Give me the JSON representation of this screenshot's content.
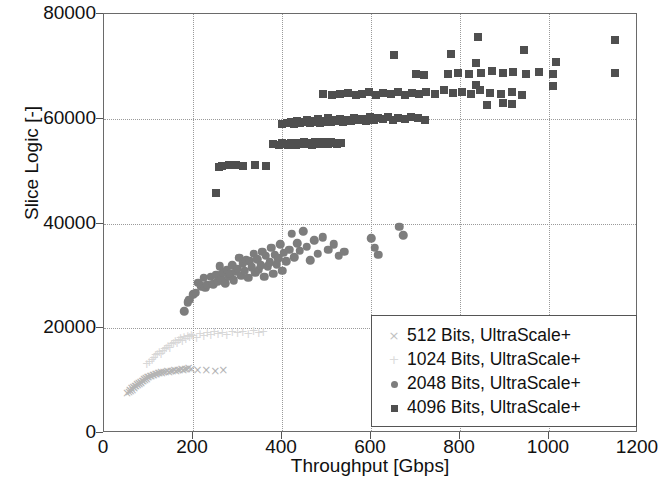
{
  "chart_data": {
    "type": "scatter",
    "title": "",
    "xlabel": "Throughput [Gbps]",
    "ylabel": "Slice Logic [-]",
    "xlim": [
      0,
      1200
    ],
    "ylim": [
      0,
      80000
    ],
    "xticks": [
      0,
      200,
      400,
      600,
      800,
      1000,
      1200
    ],
    "yticks": [
      0,
      20000,
      40000,
      60000,
      80000
    ],
    "grid": true,
    "legend_position": "lower right",
    "series": [
      {
        "name": "512 Bits, UltraScale+",
        "marker": "x",
        "color": "#b4b4b4",
        "points": [
          [
            52,
            7600
          ],
          [
            56,
            7900
          ],
          [
            58,
            8200
          ],
          [
            60,
            8000
          ],
          [
            62,
            8500
          ],
          [
            64,
            8300
          ],
          [
            66,
            8800
          ],
          [
            68,
            8600
          ],
          [
            70,
            9000
          ],
          [
            72,
            8900
          ],
          [
            74,
            9300
          ],
          [
            76,
            9100
          ],
          [
            78,
            9500
          ],
          [
            80,
            9400
          ],
          [
            82,
            9800
          ],
          [
            84,
            9600
          ],
          [
            86,
            10000
          ],
          [
            88,
            9900
          ],
          [
            90,
            10300
          ],
          [
            92,
            10100
          ],
          [
            94,
            10500
          ],
          [
            96,
            10400
          ],
          [
            98,
            10700
          ],
          [
            100,
            10600
          ],
          [
            104,
            10900
          ],
          [
            106,
            10800
          ],
          [
            110,
            11100
          ],
          [
            112,
            11000
          ],
          [
            116,
            11300
          ],
          [
            118,
            11200
          ],
          [
            122,
            11500
          ],
          [
            124,
            11400
          ],
          [
            128,
            11600
          ],
          [
            130,
            11500
          ],
          [
            134,
            11700
          ],
          [
            138,
            11600
          ],
          [
            142,
            11800
          ],
          [
            146,
            11700
          ],
          [
            150,
            11900
          ],
          [
            154,
            11800
          ],
          [
            158,
            12000
          ],
          [
            162,
            11900
          ],
          [
            166,
            12100
          ],
          [
            170,
            12000
          ],
          [
            174,
            12200
          ],
          [
            178,
            12100
          ],
          [
            182,
            12300
          ],
          [
            186,
            12200
          ],
          [
            190,
            12400
          ],
          [
            196,
            12300
          ],
          [
            210,
            12000
          ],
          [
            230,
            12000
          ],
          [
            250,
            11900
          ],
          [
            268,
            12100
          ]
        ]
      },
      {
        "name": "1024 Bits, UltraScale+",
        "marker": "+",
        "color": "#d8d8d8",
        "points": [
          [
            96,
            13200
          ],
          [
            102,
            13600
          ],
          [
            108,
            14000
          ],
          [
            112,
            14400
          ],
          [
            116,
            14800
          ],
          [
            120,
            15100
          ],
          [
            124,
            15400
          ],
          [
            128,
            15000
          ],
          [
            132,
            15700
          ],
          [
            136,
            16000
          ],
          [
            140,
            16300
          ],
          [
            144,
            16600
          ],
          [
            148,
            16200
          ],
          [
            152,
            16900
          ],
          [
            156,
            17200
          ],
          [
            160,
            17500
          ],
          [
            164,
            17100
          ],
          [
            168,
            17800
          ],
          [
            172,
            18100
          ],
          [
            176,
            17600
          ],
          [
            180,
            18400
          ],
          [
            184,
            18000
          ],
          [
            188,
            18600
          ],
          [
            192,
            18300
          ],
          [
            196,
            18800
          ],
          [
            200,
            18500
          ],
          [
            208,
            18200
          ],
          [
            216,
            18900
          ],
          [
            224,
            18600
          ],
          [
            232,
            19000
          ],
          [
            240,
            18700
          ],
          [
            248,
            19200
          ],
          [
            256,
            18900
          ],
          [
            266,
            19100
          ],
          [
            276,
            18800
          ],
          [
            288,
            19300
          ],
          [
            300,
            19000
          ],
          [
            312,
            19200
          ],
          [
            324,
            18900
          ],
          [
            336,
            19400
          ],
          [
            348,
            19100
          ],
          [
            358,
            19300
          ]
        ]
      },
      {
        "name": "2048 Bits, UltraScale+",
        "marker": "o",
        "color": "#7d7d7d",
        "points": [
          [
            180,
            23200
          ],
          [
            188,
            25000
          ],
          [
            192,
            25400
          ],
          [
            200,
            26500
          ],
          [
            206,
            26800
          ],
          [
            212,
            28700
          ],
          [
            218,
            28000
          ],
          [
            224,
            29600
          ],
          [
            228,
            27700
          ],
          [
            232,
            28300
          ],
          [
            240,
            29800
          ],
          [
            246,
            28400
          ],
          [
            252,
            30200
          ],
          [
            256,
            29000
          ],
          [
            260,
            31800
          ],
          [
            264,
            29400
          ],
          [
            268,
            30600
          ],
          [
            272,
            28600
          ],
          [
            276,
            31200
          ],
          [
            280,
            29800
          ],
          [
            284,
            30400
          ],
          [
            288,
            32000
          ],
          [
            292,
            29200
          ],
          [
            296,
            30800
          ],
          [
            300,
            31400
          ],
          [
            304,
            33500
          ],
          [
            308,
            30000
          ],
          [
            312,
            32400
          ],
          [
            316,
            31000
          ],
          [
            320,
            33000
          ],
          [
            324,
            29600
          ],
          [
            328,
            32800
          ],
          [
            332,
            31600
          ],
          [
            336,
            34200
          ],
          [
            340,
            30600
          ],
          [
            344,
            33200
          ],
          [
            348,
            31200
          ],
          [
            352,
            32000
          ],
          [
            356,
            34600
          ],
          [
            360,
            29800
          ],
          [
            364,
            33800
          ],
          [
            368,
            31800
          ],
          [
            372,
            32600
          ],
          [
            376,
            35400
          ],
          [
            380,
            30400
          ],
          [
            384,
            34000
          ],
          [
            388,
            32200
          ],
          [
            392,
            33400
          ],
          [
            396,
            36000
          ],
          [
            400,
            31000
          ],
          [
            404,
            34400
          ],
          [
            410,
            32800
          ],
          [
            416,
            35000
          ],
          [
            422,
            38000
          ],
          [
            428,
            33600
          ],
          [
            434,
            36200
          ],
          [
            440,
            34800
          ],
          [
            448,
            38500
          ],
          [
            456,
            35600
          ],
          [
            464,
            33000
          ],
          [
            472,
            36800
          ],
          [
            480,
            34200
          ],
          [
            492,
            37400
          ],
          [
            504,
            35000
          ],
          [
            516,
            36000
          ],
          [
            528,
            33800
          ],
          [
            540,
            34600
          ],
          [
            600,
            37200
          ],
          [
            608,
            35400
          ],
          [
            616,
            34000
          ],
          [
            664,
            39400
          ],
          [
            672,
            37800
          ]
        ]
      },
      {
        "name": "4096 Bits, UltraScale+",
        "marker": "s",
        "color": "#4f4f4f",
        "points": [
          [
            252,
            45800
          ],
          [
            258,
            50800
          ],
          [
            266,
            51000
          ],
          [
            282,
            51200
          ],
          [
            296,
            51200
          ],
          [
            312,
            51000
          ],
          [
            340,
            51200
          ],
          [
            364,
            51000
          ],
          [
            380,
            55200
          ],
          [
            394,
            55000
          ],
          [
            400,
            55400
          ],
          [
            406,
            55200
          ],
          [
            414,
            55000
          ],
          [
            420,
            55400
          ],
          [
            426,
            55200
          ],
          [
            432,
            55000
          ],
          [
            438,
            55400
          ],
          [
            444,
            55200
          ],
          [
            450,
            55600
          ],
          [
            456,
            55200
          ],
          [
            462,
            55400
          ],
          [
            468,
            55000
          ],
          [
            474,
            55600
          ],
          [
            480,
            55400
          ],
          [
            486,
            55200
          ],
          [
            492,
            55600
          ],
          [
            498,
            55400
          ],
          [
            504,
            55200
          ],
          [
            510,
            55600
          ],
          [
            516,
            55400
          ],
          [
            524,
            55200
          ],
          [
            532,
            55400
          ],
          [
            400,
            59000
          ],
          [
            412,
            59200
          ],
          [
            420,
            59400
          ],
          [
            428,
            59000
          ],
          [
            434,
            59600
          ],
          [
            440,
            59200
          ],
          [
            448,
            59400
          ],
          [
            456,
            59800
          ],
          [
            462,
            59200
          ],
          [
            468,
            59600
          ],
          [
            474,
            59400
          ],
          [
            480,
            60000
          ],
          [
            486,
            59200
          ],
          [
            492,
            59600
          ],
          [
            498,
            59400
          ],
          [
            504,
            60200
          ],
          [
            510,
            59400
          ],
          [
            516,
            59800
          ],
          [
            522,
            59600
          ],
          [
            530,
            60000
          ],
          [
            538,
            59400
          ],
          [
            546,
            59800
          ],
          [
            554,
            59600
          ],
          [
            562,
            60200
          ],
          [
            570,
            59800
          ],
          [
            580,
            60000
          ],
          [
            588,
            59600
          ],
          [
            598,
            60400
          ],
          [
            606,
            59800
          ],
          [
            616,
            60200
          ],
          [
            626,
            60000
          ],
          [
            638,
            60400
          ],
          [
            650,
            59800
          ],
          [
            660,
            60200
          ],
          [
            676,
            60000
          ],
          [
            690,
            60400
          ],
          [
            706,
            60200
          ],
          [
            722,
            59800
          ],
          [
            492,
            64800
          ],
          [
            512,
            64600
          ],
          [
            530,
            64800
          ],
          [
            548,
            65000
          ],
          [
            566,
            64600
          ],
          [
            580,
            64800
          ],
          [
            596,
            65200
          ],
          [
            612,
            64600
          ],
          [
            628,
            65000
          ],
          [
            644,
            64800
          ],
          [
            660,
            65200
          ],
          [
            676,
            64600
          ],
          [
            692,
            65000
          ],
          [
            708,
            64800
          ],
          [
            724,
            65200
          ],
          [
            744,
            64800
          ],
          [
            764,
            65400
          ],
          [
            784,
            65000
          ],
          [
            804,
            65200
          ],
          [
            824,
            64800
          ],
          [
            844,
            65400
          ],
          [
            868,
            65000
          ],
          [
            892,
            64800
          ],
          [
            916,
            65200
          ],
          [
            940,
            64600
          ],
          [
            700,
            68600
          ],
          [
            720,
            68400
          ],
          [
            772,
            68600
          ],
          [
            796,
            68800
          ],
          [
            820,
            68600
          ],
          [
            848,
            68800
          ],
          [
            872,
            69200
          ],
          [
            896,
            68800
          ],
          [
            920,
            69000
          ],
          [
            948,
            68600
          ],
          [
            978,
            69000
          ],
          [
            1008,
            68600
          ],
          [
            1148,
            68800
          ],
          [
            652,
            72200
          ],
          [
            780,
            72400
          ],
          [
            840,
            75600
          ],
          [
            1148,
            75000
          ],
          [
            944,
            73200
          ],
          [
            896,
            63000
          ],
          [
            916,
            62800
          ],
          [
            860,
            62600
          ],
          [
            836,
            66400
          ],
          [
            1008,
            66200
          ],
          [
            836,
            70600
          ],
          [
            1016,
            70800
          ]
        ]
      }
    ]
  },
  "axes": {
    "ytick_labels": [
      "0",
      "20000",
      "40000",
      "60000",
      "80000"
    ],
    "xtick_labels": [
      "0",
      "200",
      "400",
      "600",
      "800",
      "1000",
      "1200"
    ]
  },
  "legend": {
    "entries": [
      {
        "label": "512 Bits, UltraScale+",
        "marker": "cross-marker-icon"
      },
      {
        "label": "1024 Bits, UltraScale+",
        "marker": "plus-marker-icon"
      },
      {
        "label": "2048 Bits, UltraScale+",
        "marker": "circle-marker-icon"
      },
      {
        "label": "4096 Bits, UltraScale+",
        "marker": "square-marker-icon"
      }
    ]
  }
}
